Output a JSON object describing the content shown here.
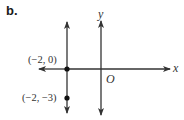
{
  "part_label": "b.",
  "axes": {
    "x_label": "x",
    "y_label": "y",
    "origin_label": "O"
  },
  "vertical_line": {
    "equation": "x = -2"
  },
  "points": [
    {
      "label": "(−2, 0)",
      "x": -2,
      "y": 0
    },
    {
      "label": "(−2, −3)",
      "x": -2,
      "y": -3
    }
  ],
  "colors": {
    "line": "#333333",
    "text": "#333333"
  }
}
